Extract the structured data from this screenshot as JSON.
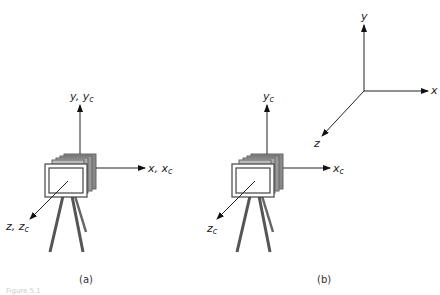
{
  "figure": {
    "panel_a": {
      "caption": "(a)",
      "labels": {
        "y_prefix": "y, ",
        "y_base": "y",
        "y_sub": "c",
        "x_prefix": "x, ",
        "x_base": "x",
        "x_sub": "c",
        "z_prefix": "z, ",
        "z_base": "z",
        "z_sub": "c"
      }
    },
    "panel_b": {
      "caption": "(b)",
      "labels": {
        "y_base": "y",
        "y_sub": "c",
        "x_base": "x",
        "x_sub": "c",
        "z_base": "z",
        "z_sub": "c"
      }
    },
    "world_frame": {
      "x": "x",
      "y": "y",
      "z": "z"
    },
    "footer_faint": "Figure 5.1"
  }
}
